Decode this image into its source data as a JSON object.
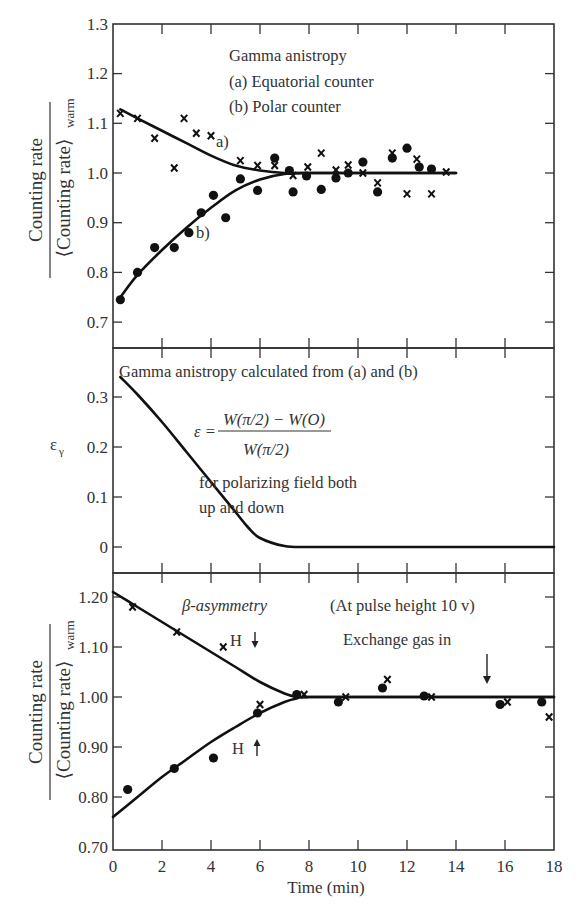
{
  "figure": {
    "xlabel": "Time (min)",
    "x_ticks": [
      "0",
      "2",
      "4",
      "6",
      "8",
      "10",
      "12",
      "14",
      "16",
      "18"
    ],
    "colors": {
      "ink": "#111111",
      "background": "#ffffff",
      "axis": "#333333"
    }
  },
  "panels": {
    "top": {
      "ylabel_numerator": "Counting rate",
      "ylabel_denominator": "⟨Counting rate⟩",
      "ylabel_subscript": "warm",
      "y_ticks": [
        "1.3",
        "1.2",
        "1.1",
        "1.0",
        "0.9",
        "0.8",
        "0.7"
      ],
      "title": "Gamma anistropy",
      "legend_a": "(a)  Equatorial counter",
      "legend_b": "(b)  Polar counter",
      "curve_a_label": "a)",
      "curve_b_label": "b)"
    },
    "middle": {
      "ylabel": "ε",
      "ylabel_sub": "γ",
      "y_ticks": [
        "0.3",
        "0.2",
        "0.1",
        "0"
      ],
      "title": "Gamma anistropy calculated from (a) and (b)",
      "formula_lhs": "ε =",
      "formula_num": "W(π/2) − W(O)",
      "formula_den": "W(π/2)",
      "note_line1": "for polarizing field both",
      "note_line2": "up and down"
    },
    "bottom": {
      "ylabel_numerator": "Counting rate",
      "ylabel_denominator": "⟨Counting rate⟩",
      "ylabel_subscript": "warm",
      "y_ticks": [
        "1.20",
        "1.10",
        "1.00",
        "0.90",
        "0.80",
        "0.70"
      ],
      "title": "β-asymmetry",
      "pulse_note": "(At pulse height 10 v)",
      "exchange_note": "Exchange gas in",
      "h_down_label": "H",
      "h_up_label": "H"
    }
  },
  "chart_data": [
    {
      "type": "scatter",
      "title": "Gamma anistropy",
      "xlabel": "Time (min)",
      "ylabel": "Counting rate / ⟨Counting rate⟩warm",
      "xlim": [
        0,
        18
      ],
      "ylim": [
        0.7,
        1.3
      ],
      "grid": false,
      "legend": [
        "(a) Equatorial counter",
        "(b) Polar counter"
      ],
      "series": [
        {
          "name": "(a) Equatorial counter",
          "marker": "x",
          "x": [
            0.3,
            1.0,
            1.7,
            2.5,
            2.9,
            3.4,
            4.0,
            5.2,
            5.9,
            6.6,
            7.35,
            7.95,
            8.5,
            9.1,
            9.6,
            10.2,
            10.8,
            11.4,
            12.0,
            12.4,
            13.0,
            13.6
          ],
          "y": [
            1.12,
            1.11,
            1.07,
            1.01,
            1.11,
            1.08,
            1.075,
            1.025,
            1.015,
            1.015,
            0.995,
            1.012,
            1.04,
            1.006,
            1.016,
            1.0,
            0.98,
            1.04,
            0.958,
            1.028,
            0.958,
            1.002
          ]
        },
        {
          "name": "(b) Polar counter",
          "marker": "o",
          "x": [
            0.3,
            1.0,
            1.7,
            2.5,
            3.1,
            3.6,
            4.1,
            4.6,
            5.2,
            5.9,
            6.6,
            7.2,
            7.35,
            7.9,
            8.5,
            9.1,
            9.6,
            10.2,
            10.8,
            11.4,
            12.0,
            12.5,
            13.0
          ],
          "y": [
            0.745,
            0.8,
            0.85,
            0.85,
            0.88,
            0.92,
            0.955,
            0.91,
            0.988,
            0.965,
            1.03,
            1.005,
            0.962,
            0.994,
            0.967,
            0.99,
            1.0,
            1.022,
            0.962,
            1.03,
            1.05,
            1.012,
            1.008
          ]
        },
        {
          "name": "a) fit",
          "type": "line",
          "x": [
            0.3,
            1,
            2,
            3,
            4,
            5,
            6,
            7,
            8,
            10,
            14
          ],
          "y": [
            1.128,
            1.11,
            1.085,
            1.06,
            1.035,
            1.015,
            1.005,
            1.0,
            1.0,
            1.0,
            1.0
          ]
        },
        {
          "name": "b) fit",
          "type": "line",
          "x": [
            0.3,
            1,
            2,
            3,
            4,
            5,
            6,
            7,
            8,
            10,
            14
          ],
          "y": [
            0.75,
            0.795,
            0.845,
            0.89,
            0.93,
            0.965,
            0.987,
            0.998,
            1.0,
            1.0,
            1.0
          ]
        }
      ]
    },
    {
      "type": "line",
      "title": "Gamma anistropy calculated from (a) and (b)",
      "xlabel": "Time (min)",
      "ylabel": "εγ",
      "xlim": [
        0,
        18
      ],
      "ylim": [
        -0.05,
        0.35
      ],
      "annotations": [
        "ε = (W(π/2) − W(O)) / W(π/2)",
        "for polarizing field both up and down"
      ],
      "series": [
        {
          "name": "εγ",
          "x": [
            0.3,
            1,
            2,
            3,
            4,
            5,
            5.5,
            6,
            7,
            8,
            10,
            14,
            18
          ],
          "y": [
            0.34,
            0.305,
            0.25,
            0.19,
            0.13,
            0.07,
            0.04,
            0.018,
            0.002,
            0.0,
            0.0,
            0.0,
            0.0
          ]
        }
      ]
    },
    {
      "type": "scatter",
      "title": "β-asymmetry",
      "xlabel": "Time (min)",
      "ylabel": "Counting rate / ⟨Counting rate⟩warm",
      "xlim": [
        0,
        18
      ],
      "ylim": [
        0.7,
        1.2
      ],
      "annotations": [
        "(At pulse height 10 v)",
        "Exchange gas in (arrow at ≈15.3 min)",
        "H↓",
        "H↑"
      ],
      "series": [
        {
          "name": "H↓",
          "marker": "x",
          "x": [
            0.8,
            2.6,
            4.5,
            6.0,
            7.8,
            9.5,
            11.2,
            13.0,
            16.1,
            17.8
          ],
          "y": [
            1.18,
            1.13,
            1.1,
            0.985,
            1.005,
            1.0,
            1.035,
            1.0,
            0.99,
            0.96
          ]
        },
        {
          "name": "H↑",
          "marker": "o",
          "x": [
            0.6,
            2.5,
            4.1,
            5.9,
            7.5,
            9.2,
            11.0,
            12.7,
            15.8,
            17.5
          ],
          "y": [
            0.815,
            0.857,
            0.878,
            0.968,
            1.005,
            0.99,
            1.018,
            1.002,
            0.985,
            0.99
          ]
        },
        {
          "name": "H↓ fit",
          "type": "line",
          "x": [
            0,
            1,
            2,
            3,
            4,
            5,
            6,
            7,
            7.5,
            8,
            12,
            18
          ],
          "y": [
            1.21,
            1.18,
            1.15,
            1.12,
            1.09,
            1.06,
            1.03,
            1.007,
            1.0,
            1.0,
            1.0,
            1.0
          ]
        },
        {
          "name": "H↑ fit",
          "type": "line",
          "x": [
            0,
            1,
            2,
            3,
            4,
            5,
            6,
            7,
            7.5,
            8,
            12,
            18
          ],
          "y": [
            0.76,
            0.8,
            0.84,
            0.875,
            0.91,
            0.94,
            0.968,
            0.99,
            0.997,
            1.0,
            1.0,
            1.0
          ]
        }
      ]
    }
  ]
}
